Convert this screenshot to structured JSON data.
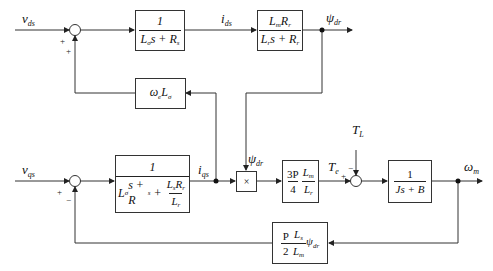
{
  "diagram": {
    "type": "induction-motor-vector-control-block-diagram",
    "signals": {
      "v_ds": {
        "sym": "v",
        "sub": "ds"
      },
      "i_ds": {
        "sym": "i",
        "sub": "ds"
      },
      "psi_dr_out": {
        "sym": "ψ",
        "sub": "dr"
      },
      "v_qs": {
        "sym": "v",
        "sub": "qs"
      },
      "i_qs": {
        "sym": "i",
        "sub": "qs"
      },
      "psi_dr_mult": {
        "sym": "ψ",
        "sub": "dr"
      },
      "T_e": {
        "sym": "T",
        "sub": "e"
      },
      "T_L": {
        "sym": "T",
        "sub": "L"
      },
      "omega_m": {
        "sym": "ω",
        "sub": "m"
      }
    },
    "signs": {
      "sum_d_in": "+",
      "sum_d_fb": "+",
      "sum_q_in": "+",
      "sum_q_fb": "−",
      "sum_t_in": "+",
      "sum_t_load": "−"
    },
    "blocks": {
      "d_current": {
        "num": "1",
        "den_parts": [
          "L",
          "σ",
          "s + R",
          "s"
        ]
      },
      "flux": {
        "num_parts": [
          "L",
          "m",
          "R",
          "r"
        ],
        "den_parts": [
          "L",
          "r",
          "s + R",
          "r"
        ]
      },
      "cross_coupling": {
        "parts": [
          "ω",
          "e",
          "L",
          "σ"
        ]
      },
      "q_current": {
        "num": "1",
        "den_parts": [
          "L",
          "σ",
          "s + R",
          "s",
          " + "
        ],
        "inner_num_parts": [
          "L",
          "s",
          "R",
          "r"
        ],
        "inner_den_parts": [
          "L",
          "r"
        ]
      },
      "multiplier": {
        "symbol": "×"
      },
      "torque_gain": {
        "num1": "3P",
        "den1": "4",
        "num2_parts": [
          "L",
          "m"
        ],
        "den2_parts": [
          "L",
          "r"
        ]
      },
      "mechanical": {
        "num": "1",
        "den": "Js + B"
      },
      "back_emf": {
        "num1": "P",
        "den1": "2",
        "num2_parts": [
          "L",
          "s"
        ],
        "den2_parts": [
          "L",
          "m"
        ],
        "tail_parts": [
          "ψ",
          "dr"
        ]
      }
    }
  }
}
